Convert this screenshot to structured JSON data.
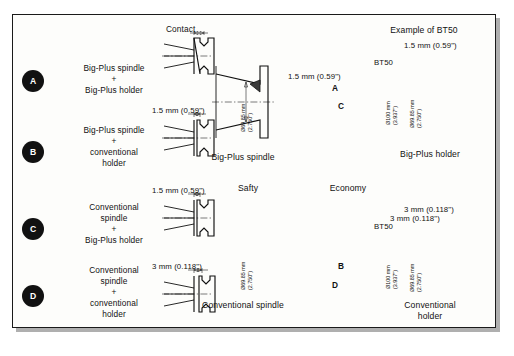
{
  "diagram": {
    "title_example": "Example of BT50",
    "axis_labels": {
      "left": "Safty",
      "right": "Economy"
    },
    "contact_label": "Contact",
    "rows": [
      {
        "letter": "A",
        "description_lines": [
          "Big-Plus spindle",
          "+",
          "Big-Plus holder"
        ],
        "gap_label": "",
        "marker": "A"
      },
      {
        "letter": "B",
        "description_lines": [
          "Big-Plus spindle",
          "+",
          "conventional",
          "holder"
        ],
        "gap_label": "1.5 mm (0.59\")",
        "marker": "B"
      },
      {
        "letter": "C",
        "description_lines": [
          "Conventional",
          "spindle",
          "+",
          "Big-Plus holder"
        ],
        "gap_label": "1.5 mm (0.59\")",
        "marker": "C"
      },
      {
        "letter": "D",
        "description_lines": [
          "Conventional",
          "spindle",
          "+",
          "conventional",
          "holder"
        ],
        "gap_label": "3 mm (0.118\")",
        "marker": "D"
      }
    ],
    "spindles": [
      {
        "name": "Big-Plus spindle",
        "gap_label": "1.5 mm (0.59\")",
        "diameter": "Ø69.85 mm",
        "diameter_inch": "(2.750\")"
      },
      {
        "name": "Conventional spindle",
        "gap_label": "3 mm (0.118\")",
        "diameter": "Ø69.85 mm",
        "diameter_inch": "(2.750\")"
      }
    ],
    "holders": [
      {
        "name_line1": "Big-Plus holder",
        "name_line2": "",
        "taper": "BT50",
        "gap_label": "1.5 mm (0.59\")",
        "flange_dia": "Ø100 mm",
        "flange_dia_inch": "(3.937\")",
        "taper_dia": "Ø69.85 mm",
        "taper_dia_inch": "(2.750\")"
      },
      {
        "name_line1": "Conventional",
        "name_line2": "holder",
        "taper": "BT50",
        "gap_label": "3 mm (0.118\")",
        "flange_dia": "Ø100 mm",
        "flange_dia_inch": "(3.937\")",
        "taper_dia": "Ø69.85 mm",
        "taper_dia_inch": "(2.750\")"
      }
    ]
  }
}
